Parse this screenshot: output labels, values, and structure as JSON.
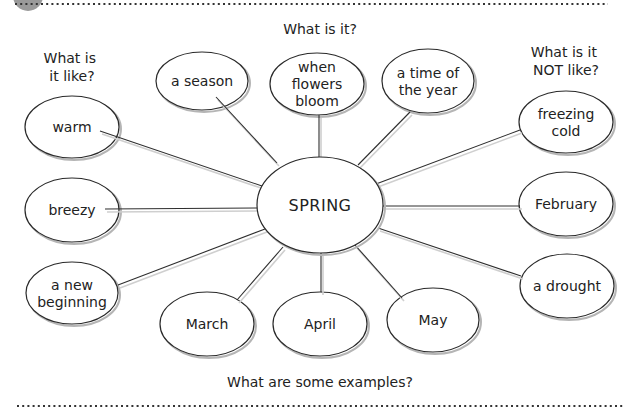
{
  "diagram": {
    "type": "concept-map",
    "center": {
      "label": "SPRING",
      "cx": 320,
      "cy": 205,
      "rx": 63,
      "ry": 48
    },
    "questions": {
      "top": "What is it?",
      "left": [
        "What is",
        "it like?"
      ],
      "right": [
        "What is it",
        "NOT like?"
      ],
      "bottom": "What are some examples?"
    },
    "nodes": [
      {
        "id": "a-season",
        "group": "what-is-it",
        "lines": [
          "a season"
        ],
        "cx": 202,
        "cy": 81,
        "rx": 46,
        "ry": 29,
        "link": [
          216,
          97,
          277,
          163
        ]
      },
      {
        "id": "when-flowers-bloom",
        "group": "what-is-it",
        "lines": [
          "when",
          "flowers",
          "bloom"
        ],
        "cx": 317,
        "cy": 84,
        "rx": 47,
        "ry": 31,
        "link": [
          319,
          115,
          319,
          157
        ]
      },
      {
        "id": "a-time-of-the-year",
        "group": "what-is-it",
        "lines": [
          "a time of",
          "the year"
        ],
        "cx": 428,
        "cy": 81,
        "rx": 46,
        "ry": 32,
        "link": [
          410,
          112,
          358,
          165
        ]
      },
      {
        "id": "warm",
        "group": "what-is-it-like",
        "lines": [
          "warm"
        ],
        "cx": 72,
        "cy": 127,
        "rx": 47,
        "ry": 31,
        "link": [
          100,
          131,
          262,
          186
        ]
      },
      {
        "id": "breezy",
        "group": "what-is-it-like",
        "lines": [
          "breezy"
        ],
        "cx": 72,
        "cy": 210,
        "rx": 47,
        "ry": 32,
        "link": [
          105,
          209,
          257,
          208
        ]
      },
      {
        "id": "a-new-beginning",
        "group": "what-is-it-like",
        "lines": [
          "a new",
          "beginning"
        ],
        "cx": 72,
        "cy": 293,
        "rx": 46,
        "ry": 31,
        "link": [
          118,
          285,
          265,
          229
        ]
      },
      {
        "id": "freezing-cold",
        "group": "what-is-it-not-like",
        "lines": [
          "freezing",
          "cold"
        ],
        "cx": 566,
        "cy": 122,
        "rx": 47,
        "ry": 31,
        "link": [
          520,
          130,
          376,
          184
        ]
      },
      {
        "id": "february",
        "group": "what-is-it-not-like",
        "lines": [
          "February"
        ],
        "cx": 566,
        "cy": 204,
        "rx": 47,
        "ry": 32,
        "link": [
          520,
          206,
          383,
          206
        ]
      },
      {
        "id": "a-drought",
        "group": "what-is-it-not-like",
        "lines": [
          "a drought"
        ],
        "cx": 567,
        "cy": 286,
        "rx": 47,
        "ry": 32,
        "link": [
          521,
          276,
          378,
          228
        ]
      },
      {
        "id": "march",
        "group": "examples",
        "lines": [
          "March"
        ],
        "cx": 207,
        "cy": 324,
        "rx": 47,
        "ry": 32,
        "link": [
          237,
          300,
          283,
          247
        ]
      },
      {
        "id": "april",
        "group": "examples",
        "lines": [
          "April"
        ],
        "cx": 320,
        "cy": 324,
        "rx": 47,
        "ry": 32,
        "link": [
          321,
          253,
          321,
          292
        ]
      },
      {
        "id": "may",
        "group": "examples",
        "lines": [
          "May"
        ],
        "cx": 433,
        "cy": 320,
        "rx": 46,
        "ry": 32,
        "link": [
          355,
          245,
          402,
          298
        ]
      }
    ]
  }
}
